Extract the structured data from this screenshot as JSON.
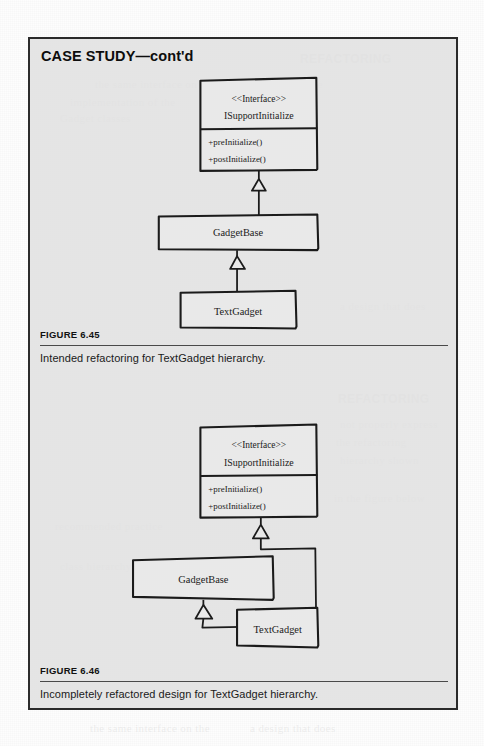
{
  "page": {
    "background_color": "#fdfdfd",
    "panel_background_color": "#e1e1e1",
    "ink_color": "#1b1b1b"
  },
  "case_study": {
    "title": "CASE STUDY—cont'd"
  },
  "figures": [
    {
      "id": "figure-6-45",
      "label": "FIGURE 6.45",
      "caption": "Intended refactoring for TextGadget hierarchy.",
      "diagram": {
        "type": "uml-class-diagram",
        "classes": [
          {
            "id": "isupportinitialize",
            "stereotype": "<<Interface>>",
            "name": "ISupportInitialize",
            "operations": [
              "+preInitialize()",
              "+postInitialize()"
            ]
          },
          {
            "id": "gadgetbase",
            "name": "GadgetBase",
            "operations": []
          },
          {
            "id": "textgadget",
            "name": "TextGadget",
            "operations": []
          }
        ],
        "relationships": [
          {
            "type": "generalization",
            "from": "gadgetbase",
            "to": "isupportinitialize"
          },
          {
            "type": "generalization",
            "from": "textgadget",
            "to": "gadgetbase"
          }
        ]
      }
    },
    {
      "id": "figure-6-46",
      "label": "FIGURE 6.46",
      "caption": "Incompletely refactored design for TextGadget hierarchy.",
      "diagram": {
        "type": "uml-class-diagram",
        "classes": [
          {
            "id": "isupportinitialize",
            "stereotype": "<<Interface>>",
            "name": "ISupportInitialize",
            "operations": [
              "+preInitialize()",
              "+postInitialize()"
            ]
          },
          {
            "id": "gadgetbase",
            "name": "GadgetBase",
            "operations": []
          },
          {
            "id": "textgadget",
            "name": "TextGadget",
            "operations": []
          }
        ],
        "relationships": [
          {
            "type": "generalization",
            "from": "textgadget",
            "to": "isupportinitialize"
          },
          {
            "type": "generalization",
            "from": "textgadget",
            "to": "gadgetbase"
          }
        ]
      }
    }
  ],
  "background_ghost_text": [
    "the same interface on the",
    "recommended practice",
    "implementation of the",
    "REFACTORING",
    "Gadget classes",
    "a design that does",
    "not properly express",
    "the refactoring",
    "hierarchy shown",
    "in the figure below",
    "class hierarchy"
  ]
}
